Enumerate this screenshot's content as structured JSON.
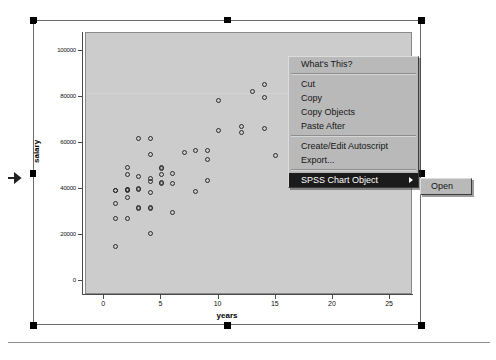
{
  "chart_data": {
    "type": "scatter",
    "title": "",
    "xlabel": "years",
    "ylabel": "salary",
    "xlim": [
      -1.6,
      27
    ],
    "ylim": [
      -6000,
      108000
    ],
    "xticks": [
      "0",
      "5",
      "10",
      "15",
      "20",
      "25"
    ],
    "xtick_values": [
      0,
      5,
      10,
      15,
      20,
      25
    ],
    "yticks": [
      "0",
      "20000",
      "40000",
      "60000",
      "80000",
      "100000"
    ],
    "ytick_values": [
      0,
      20000,
      40000,
      60000,
      80000,
      100000
    ],
    "grid": false,
    "legend": null,
    "marker": "open-circle",
    "points": [
      [
        1,
        15000
      ],
      [
        1,
        27500
      ],
      [
        1,
        34000
      ],
      [
        1,
        39500
      ],
      [
        1,
        39500
      ],
      [
        2,
        27500
      ],
      [
        2,
        36500
      ],
      [
        2,
        39500
      ],
      [
        2,
        40000
      ],
      [
        2,
        40000
      ],
      [
        2,
        46500
      ],
      [
        2,
        49500
      ],
      [
        3,
        31500
      ],
      [
        3,
        32000
      ],
      [
        3,
        40000
      ],
      [
        3,
        40500
      ],
      [
        3,
        45500
      ],
      [
        3,
        62000
      ],
      [
        4,
        20800
      ],
      [
        4,
        31500
      ],
      [
        4,
        32000
      ],
      [
        4,
        38500
      ],
      [
        4,
        43500
      ],
      [
        4,
        44500
      ],
      [
        4,
        55000
      ],
      [
        4,
        62000
      ],
      [
        5,
        42500
      ],
      [
        5,
        43000
      ],
      [
        5,
        46500
      ],
      [
        5,
        49000
      ],
      [
        5,
        49500
      ],
      [
        6,
        30000
      ],
      [
        6,
        42500
      ],
      [
        6,
        47000
      ],
      [
        7,
        56000
      ],
      [
        8,
        39000
      ],
      [
        8,
        57000
      ],
      [
        9,
        44000
      ],
      [
        9,
        53000
      ],
      [
        9,
        57000
      ],
      [
        10,
        65500
      ],
      [
        10,
        78500
      ],
      [
        12,
        64500
      ],
      [
        12,
        67500
      ],
      [
        13,
        82500
      ],
      [
        14,
        66500
      ],
      [
        14,
        80000
      ],
      [
        14,
        85500
      ],
      [
        15,
        54500
      ],
      [
        20,
        96000
      ],
      [
        22,
        95000
      ]
    ]
  },
  "context_menu": {
    "items": [
      {
        "label": "What's This?",
        "selected": false,
        "has_submenu": false
      },
      {
        "separator": true
      },
      {
        "label": "Cut",
        "selected": false,
        "has_submenu": false
      },
      {
        "label": "Copy",
        "selected": false,
        "has_submenu": false
      },
      {
        "label": "Copy Objects",
        "selected": false,
        "has_submenu": false
      },
      {
        "label": "Paste After",
        "selected": false,
        "has_submenu": false
      },
      {
        "separator": true
      },
      {
        "label": "Create/Edit Autoscript",
        "selected": false,
        "has_submenu": false
      },
      {
        "label": "Export...",
        "selected": false,
        "has_submenu": false
      },
      {
        "separator": true
      },
      {
        "label": "SPSS Chart Object",
        "selected": true,
        "has_submenu": true
      }
    ]
  },
  "submenu": {
    "items": [
      {
        "label": "Open"
      }
    ]
  },
  "selection": {
    "handle_color": "#000000",
    "frame_color": "#6b6b6b"
  },
  "colors": {
    "plot_background": "#cccccc",
    "page_background": "#ffffff",
    "menu_background": "#b9b9b9",
    "menu_highlight": "#1b1b1b",
    "marker_stroke": "#2b2b2b"
  }
}
